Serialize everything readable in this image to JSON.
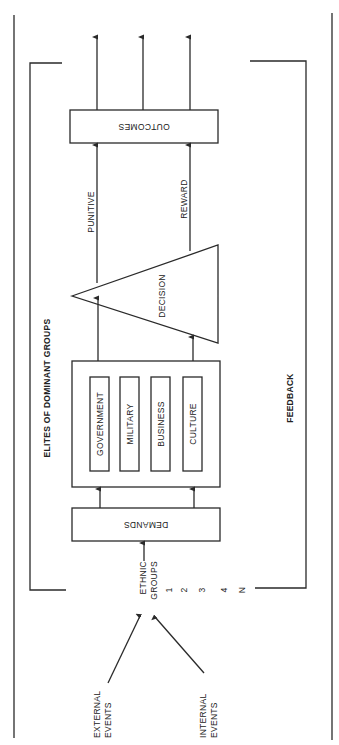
{
  "diagram": {
    "orientation": "rotated 90 degrees counter-clockwise",
    "colors": {
      "ink": "#2a2a2a",
      "background": "#ffffff"
    },
    "inputs": {
      "external_events": [
        "EXTERNAL",
        "EVENTS"
      ],
      "internal_events": [
        "INTERNAL",
        "EVENTS"
      ]
    },
    "ethnic_groups": {
      "label": [
        "ETHNIC",
        "GROUPS"
      ],
      "members": [
        "1",
        "2",
        "3",
        "4",
        "N"
      ]
    },
    "demands": {
      "label": "DEMANDS"
    },
    "elites": {
      "title": "ELITES OF DOMINANT GROUPS",
      "sectors": [
        "GOVERNMENT",
        "MILITARY",
        "BUSINESS",
        "CULTURE"
      ]
    },
    "decision": {
      "label": "DECISION"
    },
    "branches": {
      "punitive": "PUNITIVE",
      "reward": "REWARD"
    },
    "outcomes": {
      "label": "OUTCOMES"
    },
    "feedback": {
      "label": "FEEDBACK"
    }
  }
}
